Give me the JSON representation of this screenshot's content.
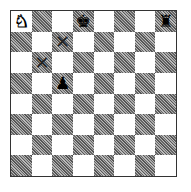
{
  "board": {
    "orientation": "white-bottom",
    "files": [
      "a",
      "b",
      "c",
      "d",
      "e",
      "f",
      "g",
      "h"
    ],
    "ranks": [
      8,
      7,
      6,
      5,
      4,
      3,
      2,
      1
    ],
    "light_color": "#ffffff",
    "dark_color": "#777777",
    "pieces": {
      "a8": {
        "glyph": "♞",
        "color": "white",
        "name": "knight"
      },
      "d8": {
        "glyph": "♚",
        "color": "black",
        "name": "king"
      },
      "h8": {
        "glyph": "♜",
        "color": "black",
        "name": "rook"
      },
      "c5": {
        "glyph": "♟",
        "color": "black",
        "name": "pawn"
      }
    },
    "marks": {
      "c7": "✕",
      "b6": "✕"
    }
  }
}
